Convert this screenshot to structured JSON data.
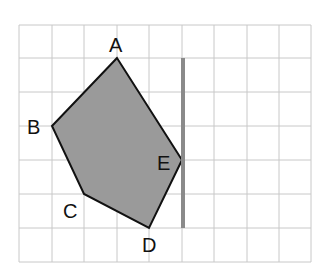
{
  "diagram": {
    "type": "polygon-on-grid",
    "grid": {
      "columns": 9,
      "rows": 7,
      "x_lines": [
        19,
        52,
        84,
        117,
        149,
        182,
        214,
        247,
        279,
        311
      ],
      "y_lines": [
        25,
        58,
        92,
        126,
        160,
        194,
        228,
        262
      ],
      "line_color": "#c8c8c8"
    },
    "polygon": {
      "fill": "#9a9a9a",
      "stroke": "#111111",
      "vertices": [
        {
          "label": "A",
          "x": 117,
          "y": 58
        },
        {
          "label": "B",
          "x": 52,
          "y": 126
        },
        {
          "label": "C",
          "x": 84,
          "y": 194
        },
        {
          "label": "D",
          "x": 149,
          "y": 228
        },
        {
          "label": "E",
          "x": 182,
          "y": 160
        }
      ]
    },
    "mirror_line": {
      "x": 183,
      "y1": 58,
      "y2": 228,
      "color": "#8a8a8a"
    },
    "labels": {
      "A": "A",
      "B": "B",
      "C": "C",
      "D": "D",
      "E": "E"
    }
  }
}
